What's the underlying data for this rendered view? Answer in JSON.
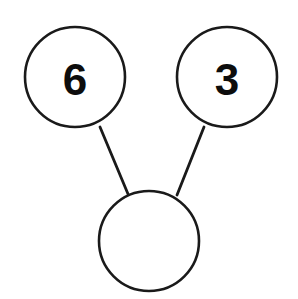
{
  "diagram": {
    "name": "number-bond",
    "type": "number-bond",
    "canvas": {
      "width": 298,
      "height": 299,
      "background": "#ffffff"
    },
    "style": {
      "stroke_color": "#1a1a1a",
      "stroke_width": 2.6,
      "fill_color": "#ffffff",
      "text_color": "#0d0d0d"
    },
    "nodes": [
      {
        "id": "part-left",
        "role": "part",
        "label": "6",
        "empty": false,
        "cx": 75,
        "cy": 77,
        "r": 50
      },
      {
        "id": "part-right",
        "role": "part",
        "label": "3",
        "empty": false,
        "cx": 227,
        "cy": 77,
        "r": 50
      },
      {
        "id": "whole-bottom",
        "role": "whole",
        "label": "",
        "empty": true,
        "cx": 149,
        "cy": 241,
        "r": 50
      }
    ],
    "connectors": [
      {
        "id": "link-left",
        "from": "part-left",
        "to": "whole-bottom",
        "x1": 100,
        "y1": 127,
        "x2": 128,
        "y2": 194
      },
      {
        "id": "link-right",
        "from": "part-right",
        "to": "whole-bottom",
        "x1": 204,
        "y1": 127,
        "x2": 177,
        "y2": 195
      }
    ]
  }
}
